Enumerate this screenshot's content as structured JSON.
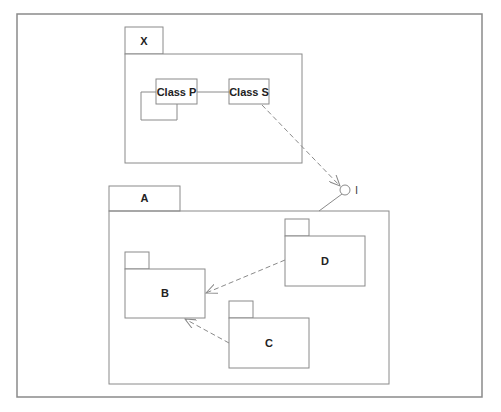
{
  "diagram": {
    "type": "UML package diagram",
    "colors": {
      "line": "#8a8a8a",
      "text": "#222222",
      "background": "#ffffff"
    },
    "packages": {
      "X": {
        "label": "X"
      },
      "A": {
        "label": "A"
      },
      "B": {
        "label": "B"
      },
      "C": {
        "label": "C"
      },
      "D": {
        "label": "D"
      }
    },
    "classes": {
      "P": {
        "label": "Class P"
      },
      "S": {
        "label": "Class S"
      }
    },
    "interface": {
      "label": "I"
    },
    "relationships": [
      {
        "from": "Class P",
        "to": "Class P",
        "kind": "self-association"
      },
      {
        "from": "Class P",
        "to": "Class S",
        "kind": "association"
      },
      {
        "from": "Class S",
        "to": "I",
        "kind": "dependency"
      },
      {
        "from": "A",
        "to": "I",
        "kind": "realization"
      },
      {
        "from": "D",
        "to": "B",
        "kind": "dependency"
      },
      {
        "from": "C",
        "to": "B",
        "kind": "dependency"
      }
    ]
  }
}
